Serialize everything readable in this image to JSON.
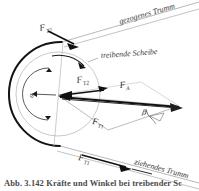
{
  "figure": {
    "title_caption": "Abb. 3.142  Kräfte und Winkel bei treibender Sc",
    "colors": {
      "ink": "#1a1a1a",
      "light_ink": "#8c8c8c",
      "background": "#ffffff",
      "label": "#2b2b2b"
    },
    "labels": {
      "belt_tight_side": "gezogenes Trumm",
      "belt_slack_side": "ziehendes Trumm",
      "driving_pulley": "treibende Scheibe",
      "force_t2_outer": "F",
      "force_t2_outer_sub": "T2",
      "force_t2_inner": "F",
      "force_t2_inner_sub": "T2",
      "force_t1_outer": "F",
      "force_t1_outer_sub": "T1",
      "force_t1_inner": "F",
      "force_t1_inner_sub": "T1",
      "force_axial": "F",
      "force_axial_sub": "A",
      "angle_beta": "β",
      "angle_alpha": "α"
    }
  }
}
